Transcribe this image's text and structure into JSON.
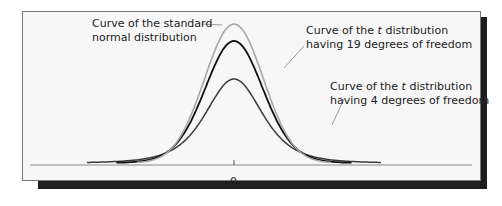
{
  "chart_data": {
    "type": "line",
    "title": "",
    "xlabel": "",
    "ylabel": "",
    "x_ticks": [
      "0"
    ],
    "grid": false,
    "legend": "annotations",
    "series": [
      {
        "name": "Standard normal distribution",
        "df": null,
        "color": "#a8a8a8",
        "peak_density": 0.399,
        "x_range": [
          -3.3,
          3.3
        ]
      },
      {
        "name": "t distribution, 19 degrees of freedom",
        "df": 19,
        "color": "#111111",
        "peak_density": 0.393,
        "x_range": [
          -4.0,
          4.0
        ]
      },
      {
        "name": "t distribution, 4 degrees of freedom",
        "df": 4,
        "color": "#3c3c3c",
        "peak_density": 0.375,
        "x_range": [
          -5.0,
          5.0
        ]
      }
    ],
    "annotations": [
      {
        "line1": "Curve of the standard",
        "line2": "normal distribution",
        "target": "Standard normal distribution"
      },
      {
        "line1_pre": "Curve of the ",
        "line1_italic": "t",
        "line1_post": " distribution",
        "line2": "having 19 degrees of freedom",
        "target": "t distribution, 19 degrees of freedom"
      },
      {
        "line1_pre": "Curve of the ",
        "line1_italic": "t",
        "line1_post": " distribution",
        "line2": "having 4 degrees of freedom",
        "target": "t distribution, 4 degrees of freedom"
      }
    ]
  },
  "labels": {
    "normal": {
      "line1": "Curve of the standard",
      "line2": "normal distribution"
    },
    "t19": {
      "pre": "Curve of the ",
      "italic": "t",
      "post": " distribution",
      "line2": "having 19 degrees of freedom"
    },
    "t4": {
      "pre": "Curve of the ",
      "italic": "t",
      "post": " distribution",
      "line2": "having 4 degrees of freedom"
    }
  },
  "axis": {
    "zero_label": "0"
  }
}
